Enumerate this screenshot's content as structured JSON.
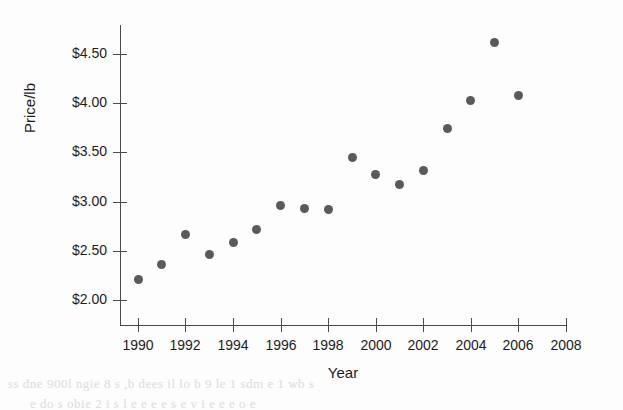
{
  "chart_data": {
    "type": "scatter",
    "title": "",
    "xlabel": "Year",
    "ylabel": "Price/lb",
    "xlim": [
      1989,
      2008.6
    ],
    "ylim": [
      1.88,
      4.82
    ],
    "grid": false,
    "legend": null,
    "x_tick_labels": [
      "1990",
      "1992",
      "1994",
      "1996",
      "1998",
      "2000",
      "2002",
      "2004",
      "2006",
      "2008"
    ],
    "x_ticks": [
      1990,
      1992,
      1994,
      1996,
      1998,
      2000,
      2002,
      2004,
      2006,
      2008
    ],
    "y_tick_labels": [
      "$2.00",
      "$2.50",
      "$3.00",
      "$3.50",
      "$4.00",
      "$4.50"
    ],
    "y_ticks": [
      2.0,
      2.5,
      3.0,
      3.5,
      4.0,
      4.5
    ],
    "marker": "filled-circle",
    "marker_color": "#5a5a5a",
    "axis_color": "#4a4a4a",
    "x": [
      1990,
      1991,
      1992,
      1993,
      1994,
      1995,
      1996,
      1997,
      1998,
      1999,
      2000,
      2001,
      2002,
      2003,
      2004,
      2005,
      2006
    ],
    "values": [
      2.21,
      2.36,
      2.67,
      2.46,
      2.58,
      2.72,
      2.96,
      2.93,
      2.92,
      3.45,
      3.28,
      3.17,
      3.32,
      3.74,
      4.03,
      4.62,
      4.08
    ],
    "points": [
      {
        "year": 1990,
        "price": 2.21
      },
      {
        "year": 1991,
        "price": 2.36
      },
      {
        "year": 1992,
        "price": 2.67
      },
      {
        "year": 1993,
        "price": 2.46
      },
      {
        "year": 1994,
        "price": 2.58
      },
      {
        "year": 1995,
        "price": 2.72
      },
      {
        "year": 1996,
        "price": 2.96
      },
      {
        "year": 1997,
        "price": 2.93
      },
      {
        "year": 1998,
        "price": 2.92
      },
      {
        "year": 1999,
        "price": 3.45
      },
      {
        "year": 2000,
        "price": 3.28
      },
      {
        "year": 2001,
        "price": 3.17
      },
      {
        "year": 2002,
        "price": 3.32
      },
      {
        "year": 2003,
        "price": 3.74
      },
      {
        "year": 2004,
        "price": 4.03
      },
      {
        "year": 2005,
        "price": 4.62
      },
      {
        "year": 2006,
        "price": 4.08
      }
    ]
  },
  "artifacts": {
    "top_bleed": "",
    "bottom_bleed_line1": "ss dne 900l ngie 8 s ,b dees il lo b 9 le 1 sdm e 1 wb s",
    "bottom_bleed_line2": "e do s obie 2 i s l  e e e e  s  e  v i  e e e o  e"
  }
}
